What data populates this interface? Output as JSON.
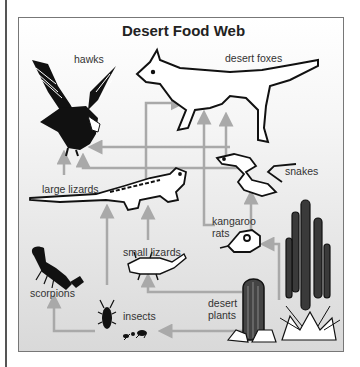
{
  "diagram": {
    "title": "Desert Food Web",
    "colors": {
      "arrow": "#a9a9a9",
      "frame_border": "#777777",
      "background_top": "#ffffff",
      "background_bottom": "#d9d9d9",
      "text": "#333333"
    },
    "organisms": {
      "hawks": "hawks",
      "desert_foxes": "desert foxes",
      "snakes": "snakes",
      "large_lizards": "large lizards",
      "kangaroo_rats_line1": "kangaroo",
      "kangaroo_rats_line2": "rats",
      "small_lizards": "small lizards",
      "scorpions": "scorpions",
      "insects": "insects",
      "desert_plants_line1": "desert",
      "desert_plants_line2": "plants"
    },
    "relationships": [
      {
        "from": "desert plants",
        "to": "insects"
      },
      {
        "from": "desert plants",
        "to": "small lizards"
      },
      {
        "from": "desert plants",
        "to": "kangaroo rats"
      },
      {
        "from": "insects",
        "to": "scorpions"
      },
      {
        "from": "insects",
        "to": "large lizards"
      },
      {
        "from": "small lizards",
        "to": "large lizards"
      },
      {
        "from": "kangaroo rats",
        "to": "snakes"
      },
      {
        "from": "kangaroo rats",
        "to": "desert foxes"
      },
      {
        "from": "large lizards",
        "to": "hawks"
      },
      {
        "from": "large lizards",
        "to": "desert foxes"
      },
      {
        "from": "snakes",
        "to": "hawks"
      },
      {
        "from": "snakes",
        "to": "desert foxes"
      }
    ]
  }
}
